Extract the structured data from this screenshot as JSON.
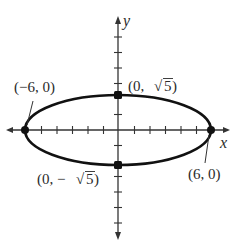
{
  "figure": {
    "type": "ellipse-graph",
    "equation_implied": "x^2/36 + y^2/5 = 1",
    "axes": {
      "x_label": "x",
      "y_label": "y",
      "x_ticks": [
        -6,
        -5,
        -4,
        -3,
        -2,
        -1,
        1,
        2,
        3,
        4,
        5,
        6
      ],
      "y_ticks": [
        -7,
        -6,
        -5,
        -4,
        -3,
        -2,
        -1,
        1,
        2,
        3,
        4,
        5,
        6
      ]
    },
    "ellipse": {
      "center": [
        0,
        0
      ],
      "a": 6,
      "b": "√5"
    },
    "points": [
      {
        "id": "left-vertex",
        "coords": [
          -6,
          0
        ],
        "label": "(−6, 0)"
      },
      {
        "id": "top-covertex",
        "coords": [
          0,
          "√5"
        ],
        "label_prefix": "(0, ",
        "label_value": "5",
        "label_suffix": ")"
      },
      {
        "id": "right-vertex",
        "coords": [
          6,
          0
        ],
        "label": "(6, 0)"
      },
      {
        "id": "bottom-covertex",
        "coords": [
          0,
          "−√5"
        ],
        "label_prefix": "(0, −",
        "label_value": "5",
        "label_suffix": ")"
      }
    ],
    "colors": {
      "ink": "#111111",
      "axis": "#333333",
      "background": "#ffffff"
    }
  }
}
